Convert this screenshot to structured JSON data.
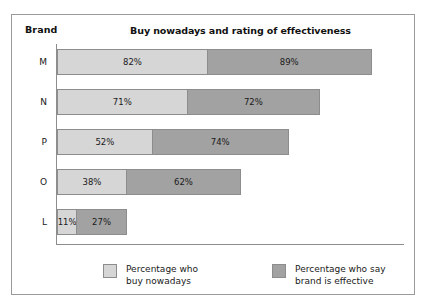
{
  "chart_data": {
    "type": "bar",
    "orientation": "horizontal",
    "layout": "grouped-stacked",
    "title": "Buy nowadays and rating of effectiveness",
    "xlabel": "",
    "ylabel": "Brand",
    "grid": false,
    "legend_position": "bottom",
    "categories": [
      "M",
      "N",
      "P",
      "O",
      "L"
    ],
    "series": [
      {
        "name": "Percentage who buy nowadays",
        "color": "#d6d6d6",
        "values": [
          82,
          71,
          52,
          38,
          11
        ],
        "labels": [
          "82%",
          "71%",
          "52%",
          "38%",
          "11%"
        ]
      },
      {
        "name": "Percentage who say brand is effective",
        "color": "#a2a2a2",
        "values": [
          89,
          72,
          74,
          62,
          27
        ],
        "labels": [
          "89%",
          "72%",
          "74%",
          "62%",
          "27%"
        ]
      }
    ],
    "axis_title": "Brand",
    "unit": "%"
  },
  "header": {
    "axis_title": "Brand",
    "chart_title": "Buy nowadays and rating of effectiveness"
  },
  "rows": [
    {
      "label": "M",
      "light_value": "82%",
      "dark_value": "89%"
    },
    {
      "label": "N",
      "light_value": "71%",
      "dark_value": "72%"
    },
    {
      "label": "P",
      "light_value": "52%",
      "dark_value": "74%"
    },
    {
      "label": "O",
      "light_value": "38%",
      "dark_value": "62%"
    },
    {
      "label": "L",
      "light_value": "11%",
      "dark_value": "27%"
    }
  ],
  "legend": {
    "buy_label": "Percentage who\nbuy nowadays",
    "effective_label": "Percentage who say\nbrand is effective",
    "light_color": "#d6d6d6",
    "dark_color": "#a2a2a2"
  }
}
